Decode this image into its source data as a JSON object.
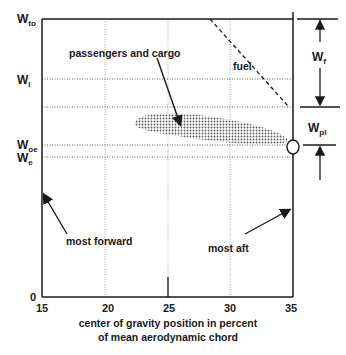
{
  "diagram": {
    "type": "center-of-gravity envelope",
    "x_axis": {
      "label_line1": "center of gravity position in percent",
      "label_line2": "of mean aerodynamic chord",
      "ticks": [
        "15",
        "20",
        "25",
        "30",
        "35"
      ],
      "range": [
        15,
        35
      ]
    },
    "y_axis": {
      "zero_label": "0",
      "levels": [
        {
          "id": "wto",
          "main": "W",
          "sub": "to"
        },
        {
          "id": "wl",
          "main": "W",
          "sub": "l"
        },
        {
          "id": "woe",
          "main": "W",
          "sub": "oe"
        },
        {
          "id": "we",
          "main": "W",
          "sub": "e"
        }
      ]
    },
    "annotations": {
      "passengers": "passengers and cargo",
      "fuel": "fuel",
      "most_forward": "most forward",
      "most_aft": "most aft"
    },
    "right_brackets": [
      {
        "id": "wf",
        "main": "W",
        "sub": "f"
      },
      {
        "id": "wpl",
        "main": "W",
        "sub": "pl"
      }
    ],
    "colors": {
      "line": "#1a1a1a",
      "grid": "#888888",
      "shade": "#6e6e6e"
    }
  }
}
